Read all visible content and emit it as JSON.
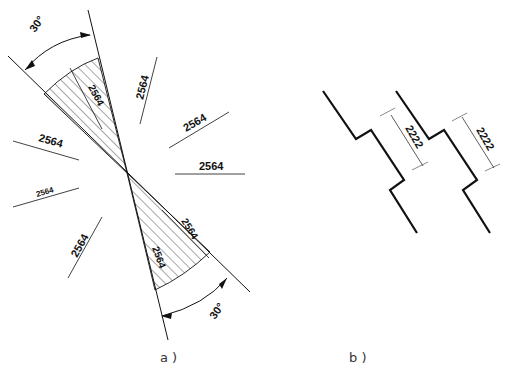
{
  "figure": {
    "panels": [
      {
        "id": "a",
        "caption": "a )",
        "angle_labels": [
          "30°",
          "30°"
        ],
        "dimensions": [
          {
            "value": "2564",
            "orientation": "inside-upper-sector"
          },
          {
            "value": "2564",
            "orientation": "steep-right"
          },
          {
            "value": "2564",
            "orientation": "diagonal-right"
          },
          {
            "value": "2564",
            "orientation": "horizontal-right"
          },
          {
            "value": "2564",
            "orientation": "left-upper"
          },
          {
            "value": "2564",
            "orientation": "left-middle"
          },
          {
            "value": "2564",
            "orientation": "left-lower-steep"
          },
          {
            "value": "2564",
            "orientation": "inside-lower-sector-edge"
          },
          {
            "value": "2564",
            "orientation": "inside-lower-sector"
          }
        ]
      },
      {
        "id": "b",
        "caption": "b )",
        "dimensions": [
          {
            "value": "2222"
          },
          {
            "value": "2222"
          }
        ]
      }
    ]
  },
  "colors": {
    "line": "#111111",
    "thin_line": "#333333",
    "background": "#ffffff"
  }
}
